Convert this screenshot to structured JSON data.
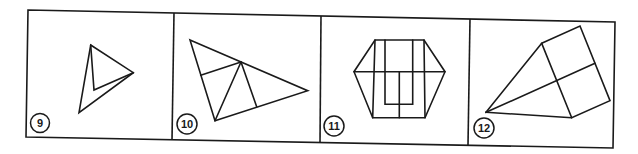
{
  "diagram": {
    "colors": {
      "background": "#ffffff",
      "line": "#1a1a1a"
    },
    "panels": [
      {
        "number": "9",
        "figure": "triangle with inner folded triangle"
      },
      {
        "number": "10",
        "figure": "triangle subdivided by internal lines"
      },
      {
        "number": "11",
        "figure": "hexagon with vertical bars and inner U shape"
      },
      {
        "number": "12",
        "figure": "kite / square with cross lines from apex"
      }
    ]
  }
}
